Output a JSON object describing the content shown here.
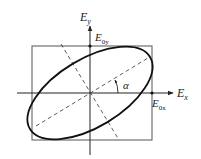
{
  "figure": {
    "axes": {
      "x_label": "E",
      "x_sub": "x",
      "y_label": "E",
      "y_sub": "y"
    },
    "amplitudes": {
      "x_label": "E",
      "x_sub": "0x",
      "y_label": "E",
      "y_sub": "0y"
    },
    "angle_label": "α"
  },
  "colors": {
    "stroke": "#222222",
    "box": "#555555",
    "background": "#ffffff"
  }
}
